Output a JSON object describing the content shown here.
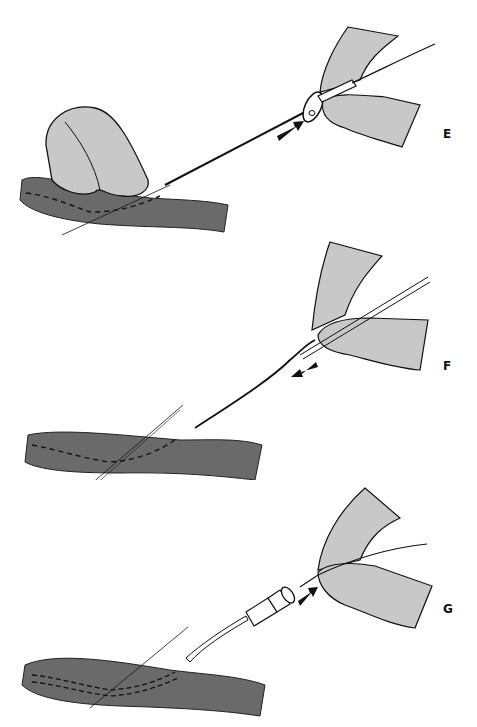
{
  "figure": {
    "panels": [
      {
        "label": "E",
        "description": "Guidewire advanced through needle into vessel",
        "arrow_direction": "forward"
      },
      {
        "label": "F",
        "description": "Needle withdrawn over guidewire",
        "arrow_direction": "backward"
      },
      {
        "label": "G",
        "description": "Catheter threaded over guidewire into vessel",
        "arrow_direction": "forward"
      }
    ]
  },
  "colors": {
    "skin": "#c8c8c8",
    "vessel": "#6a6a6a",
    "outline": "#111111",
    "background": "#ffffff"
  }
}
